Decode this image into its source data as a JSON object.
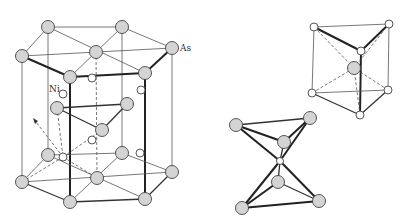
{
  "figure": {
    "labels": {
      "as": "As",
      "ni": "Ni"
    },
    "colors": {
      "as_fill": "#d4d4d4",
      "ni_fill": "#ffffff",
      "line": "#333333"
    }
  },
  "main_cell": {
    "as_atoms": [
      [
        48,
        27
      ],
      [
        122,
        27
      ],
      [
        172,
        48
      ],
      [
        145,
        73
      ],
      [
        70,
        77
      ],
      [
        22,
        56
      ],
      [
        96,
        52
      ],
      [
        57,
        108
      ],
      [
        127,
        104
      ],
      [
        102,
        130
      ],
      [
        22,
        182
      ],
      [
        70,
        202
      ],
      [
        145,
        199
      ],
      [
        172,
        172
      ],
      [
        122,
        153
      ],
      [
        48,
        155
      ],
      [
        97,
        178
      ]
    ],
    "ni_atoms": [
      [
        92,
        78
      ],
      [
        141,
        90
      ],
      [
        63,
        94
      ],
      [
        92,
        140
      ],
      [
        140,
        153
      ],
      [
        63,
        157
      ]
    ]
  },
  "prism_panel": {
    "title": "Trigonal prism around As",
    "center_as": [
      354,
      68
    ],
    "ni_corners": [
      [
        314,
        27
      ],
      [
        389,
        24
      ],
      [
        361,
        51
      ],
      [
        312,
        93
      ],
      [
        388,
        90
      ],
      [
        360,
        115
      ]
    ]
  },
  "octahedra_panel": {
    "title": "Face-sharing Ni-centered units",
    "as_atoms": [
      [
        236,
        125
      ],
      [
        310,
        118
      ],
      [
        284,
        142
      ],
      [
        278,
        182
      ],
      [
        242,
        208
      ],
      [
        319,
        201
      ]
    ],
    "ni_atom": [
      280,
      161
    ]
  }
}
